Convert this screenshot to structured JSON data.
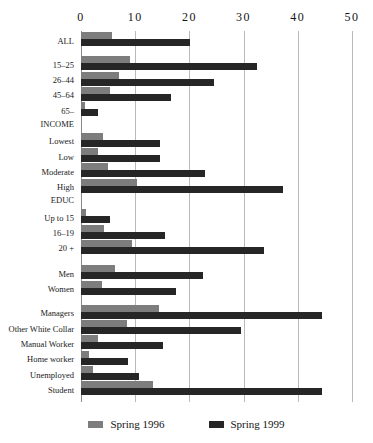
{
  "chart_data": {
    "type": "bar",
    "orientation": "horizontal",
    "title": "",
    "xlabel": "",
    "ylabel": "",
    "xlim": [
      0,
      50
    ],
    "xticks": [
      0,
      10,
      20,
      30,
      40,
      50
    ],
    "xticklabels": [
      "0",
      "10",
      "20",
      "30",
      "40",
      "50"
    ],
    "grid": true,
    "legend_position": "bottom",
    "categories": [
      "ALL",
      "15–25",
      "26–44",
      "45–64",
      "65–",
      "INCOME",
      "Lowest",
      "Low",
      "Moderate",
      "High",
      "EDUC",
      "Up to 15",
      "16–19",
      "20 +",
      "Men",
      "Women",
      "Managers",
      "Other White Collar",
      "Manual Worker",
      "Home worker",
      "Unemployed",
      "Student"
    ],
    "group_headers": [
      "INCOME",
      "EDUC"
    ],
    "series": [
      {
        "name": "Spring 1996",
        "color": "#7d7d7d",
        "values": [
          5.7,
          9.0,
          7.0,
          5.4,
          0.8,
          null,
          4.1,
          3.1,
          5.0,
          10.3,
          null,
          0.9,
          4.2,
          9.4,
          6.2,
          3.8,
          14.4,
          8.4,
          3.2,
          1.5,
          2.2,
          13.2
        ]
      },
      {
        "name": "Spring 1999",
        "color": "#262626",
        "values": [
          20.1,
          32.5,
          24.5,
          16.6,
          3.1,
          null,
          14.6,
          14.6,
          22.9,
          37.3,
          null,
          5.4,
          15.5,
          33.8,
          22.5,
          17.5,
          44.5,
          29.5,
          15.2,
          8.7,
          10.7,
          44.5
        ]
      }
    ]
  },
  "legend": {
    "items": [
      {
        "label": "Spring 1996",
        "swatch": "s1996"
      },
      {
        "label": "Spring 1999",
        "swatch": "s1999"
      }
    ]
  }
}
